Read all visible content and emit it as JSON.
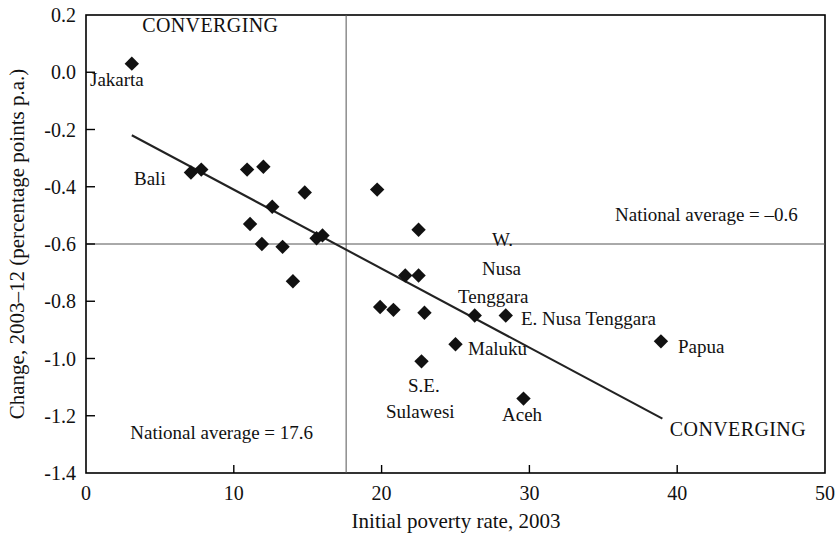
{
  "chart_data": {
    "type": "scatter",
    "title": "",
    "xlabel": "Initial poverty rate, 2003",
    "ylabel": "Change, 2003–12 (percentage points p.a.)",
    "xlim": [
      0,
      50
    ],
    "ylim": [
      -1.4,
      0.2
    ],
    "xticks": [
      "0",
      "10",
      "20",
      "30",
      "40",
      "50"
    ],
    "xtick_values": [
      0,
      10,
      20,
      30,
      40,
      50
    ],
    "yticks": [
      "0.2",
      "0.0",
      "-0.2",
      "-0.4",
      "-0.6",
      "-0.8",
      "-1.0",
      "-1.2",
      "-1.4"
    ],
    "ytick_values": [
      0.2,
      0.0,
      -0.2,
      -0.4,
      -0.6,
      -0.8,
      -1.0,
      -1.2,
      -1.4
    ],
    "grid": false,
    "legend": "none",
    "reference_lines": [
      {
        "name": "national-average-poverty-rate",
        "orientation": "vertical",
        "value": 17.6,
        "label": "National average = 17.6"
      },
      {
        "name": "national-average-change",
        "orientation": "horizontal",
        "value": -0.6,
        "label": "National average = –0.6"
      }
    ],
    "trend_line": {
      "x1": 3.1,
      "y1": -0.22,
      "x2": 39.0,
      "y2": -1.21
    },
    "points": [
      {
        "x": 3.1,
        "y": 0.03,
        "label": "Jakarta"
      },
      {
        "x": 7.1,
        "y": -0.35,
        "label": "Bali"
      },
      {
        "x": 7.8,
        "y": -0.34,
        "label": ""
      },
      {
        "x": 10.9,
        "y": -0.34,
        "label": ""
      },
      {
        "x": 12.0,
        "y": -0.33,
        "label": ""
      },
      {
        "x": 11.1,
        "y": -0.53,
        "label": ""
      },
      {
        "x": 12.6,
        "y": -0.47,
        "label": ""
      },
      {
        "x": 11.9,
        "y": -0.6,
        "label": ""
      },
      {
        "x": 13.3,
        "y": -0.61,
        "label": ""
      },
      {
        "x": 14.8,
        "y": -0.42,
        "label": ""
      },
      {
        "x": 14.0,
        "y": -0.73,
        "label": ""
      },
      {
        "x": 15.6,
        "y": -0.58,
        "label": ""
      },
      {
        "x": 16.0,
        "y": -0.57,
        "label": ""
      },
      {
        "x": 19.7,
        "y": -0.41,
        "label": ""
      },
      {
        "x": 22.5,
        "y": -0.55,
        "label": ""
      },
      {
        "x": 21.6,
        "y": -0.71,
        "label": ""
      },
      {
        "x": 22.5,
        "y": -0.71,
        "label": ""
      },
      {
        "x": 19.9,
        "y": -0.82,
        "label": ""
      },
      {
        "x": 20.8,
        "y": -0.83,
        "label": ""
      },
      {
        "x": 22.9,
        "y": -0.84,
        "label": ""
      },
      {
        "x": 26.3,
        "y": -0.85,
        "label": "W. Nusa Tenggara"
      },
      {
        "x": 28.4,
        "y": -0.85,
        "label": "E. Nusa Tenggara"
      },
      {
        "x": 25.0,
        "y": -0.95,
        "label": "Maluku"
      },
      {
        "x": 22.7,
        "y": -1.01,
        "label": "S.E. Sulawesi"
      },
      {
        "x": 29.6,
        "y": -1.14,
        "label": "Aceh"
      },
      {
        "x": 38.9,
        "y": -0.94,
        "label": "Papua"
      }
    ],
    "annotations": [
      {
        "name": "converging-top-left",
        "text": "CONVERGING",
        "x": 3.8,
        "y": 0.14
      },
      {
        "name": "converging-bottom-right",
        "text": "CONVERGING",
        "x": 39.5,
        "y": -1.27
      },
      {
        "name": "national-average-change-label",
        "text": "National average = –0.6",
        "x": 35.8,
        "y": -0.52
      },
      {
        "name": "national-average-poverty-label",
        "text": "National average = 17.6",
        "x": 3.0,
        "y": -1.28
      }
    ],
    "point_labels": [
      {
        "name": "label-jakarta",
        "text": "Jakarta",
        "x": 90,
        "y": 86
      },
      {
        "name": "label-bali",
        "text": "Bali",
        "x": 134,
        "y": 185
      },
      {
        "name": "label-w-nusa-tenggara-line1",
        "text": "W.",
        "x": 492,
        "y": 246
      },
      {
        "name": "label-w-nusa-tenggara-line2",
        "text": "Nusa",
        "x": 482,
        "y": 275
      },
      {
        "name": "label-w-nusa-tenggara-line3",
        "text": "Tenggara",
        "x": 458,
        "y": 303
      },
      {
        "name": "label-e-nusa-tenggara",
        "text": "E. Nusa Tenggara",
        "x": 521,
        "y": 325
      },
      {
        "name": "label-maluku",
        "text": "Maluku",
        "x": 468,
        "y": 355
      },
      {
        "name": "label-papua",
        "text": "Papua",
        "x": 678,
        "y": 353
      },
      {
        "name": "label-se-sulawesi-line1",
        "text": "S.E.",
        "x": 408,
        "y": 392
      },
      {
        "name": "label-se-sulawesi-line2",
        "text": "Sulawesi",
        "x": 386,
        "y": 418
      },
      {
        "name": "label-aceh",
        "text": "Aceh",
        "x": 502,
        "y": 421
      }
    ],
    "colors": {
      "marker": "#111111",
      "axis": "#000000",
      "reference_line": "#555555",
      "trend_line": "#222222"
    }
  }
}
